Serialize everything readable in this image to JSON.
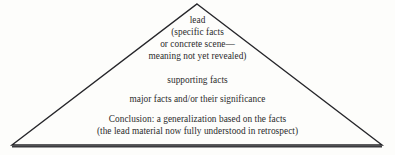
{
  "diagram": {
    "shape": "triangle",
    "name": "inverted-pyramid-news-structure",
    "outline_color": "#26262a",
    "base_color": "#3a3a3e",
    "background_color": "#fdfdfb",
    "text_color": "#2b2b2b",
    "apex": {
      "x": 197,
      "y": 4
    },
    "bottom_left": {
      "x": 12,
      "y": 146
    },
    "bottom_right": {
      "x": 382,
      "y": 146
    },
    "groups": [
      {
        "id": "lead",
        "lines": [
          "lead",
          "(specific facts",
          "or concrete scene—",
          "meaning not yet revealed)"
        ]
      },
      {
        "id": "supporting",
        "lines": [
          "supporting facts"
        ]
      },
      {
        "id": "major",
        "lines": [
          "major facts and/or their significance"
        ]
      },
      {
        "id": "conclusion",
        "lines": [
          "Conclusion: a generalization based on the facts",
          "(the lead material now fully understood in retrospect)"
        ]
      }
    ]
  }
}
